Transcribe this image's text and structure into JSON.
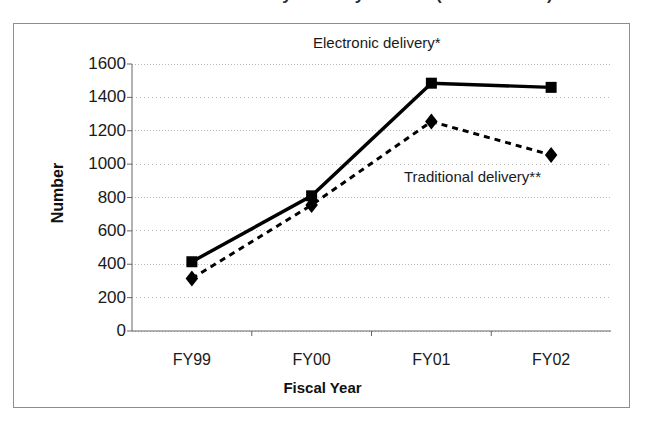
{
  "figure": {
    "cut_off_title": "Number of Orders by Delivery Method (FY1999-2002)",
    "frame_visible": true
  },
  "chart_data": {
    "type": "line",
    "title": "",
    "xlabel": "Fiscal Year",
    "ylabel": "Number",
    "categories": [
      "FY99",
      "FY00",
      "FY01",
      "FY02"
    ],
    "ylim": [
      0,
      1600
    ],
    "ytick_labels": [
      "0",
      "200",
      "400",
      "600",
      "800",
      "1000",
      "1200",
      "1400",
      "1600"
    ],
    "ytick_values": [
      0,
      200,
      400,
      600,
      800,
      1000,
      1200,
      1400,
      1600
    ],
    "grid": true,
    "grid_axis": "y",
    "grid_style": "dotted",
    "legend_position": "inline-annotations",
    "series": [
      {
        "name": "Electronic delivery*",
        "values": [
          415,
          810,
          1485,
          1460
        ],
        "marker": "square",
        "line_style": "solid",
        "color": "#000000"
      },
      {
        "name": "Traditional delivery**",
        "values": [
          315,
          755,
          1255,
          1055
        ],
        "marker": "diamond",
        "line_style": "dashed",
        "color": "#000000"
      }
    ],
    "annotations": [
      {
        "text": "Electronic delivery*",
        "series": "Electronic delivery*"
      },
      {
        "text": "Traditional delivery**",
        "series": "Traditional delivery**"
      }
    ]
  },
  "colors": {
    "ink": "#000000",
    "frame": "#8d8d8d",
    "gridline": "#b9b9b9",
    "axis": "#555555",
    "background": "#ffffff"
  }
}
